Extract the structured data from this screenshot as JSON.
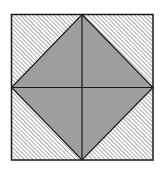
{
  "diagram": {
    "outer_square": {
      "x": 11.5,
      "y": 14.5,
      "width": 141.5,
      "height": 145.5,
      "stroke": "#1a1a1a",
      "stroke_width": 1.5
    },
    "diamond": {
      "top": [
        82,
        14.5
      ],
      "right": [
        153,
        87.5
      ],
      "bottom": [
        82,
        160
      ],
      "left": [
        11.5,
        87.5
      ],
      "fill": "#9e9e9e",
      "stroke": "#1a1a1a"
    },
    "center": [
      82,
      87.5
    ],
    "hatch": {
      "direction": "top-left to bottom-right",
      "spacing": 3,
      "color": "#555555",
      "regions": [
        "top-left-corner",
        "top-right-corner",
        "bottom-left-corner",
        "bottom-right-corner"
      ]
    },
    "divider_lines": [
      "vertical",
      "horizontal"
    ]
  }
}
